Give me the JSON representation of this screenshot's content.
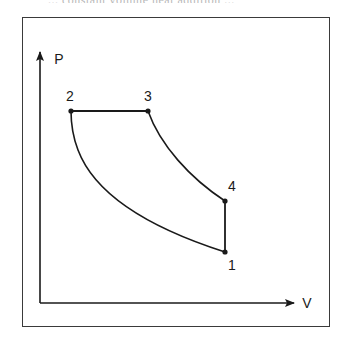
{
  "caption": {
    "text": "... constant volume heat addition ...",
    "note": "cropped, illegible"
  },
  "diagram": {
    "type": "pressure-volume cycle diagram",
    "axes": {
      "y_label": "P",
      "x_label": "V"
    },
    "points": [
      {
        "id": "1",
        "label": "1"
      },
      {
        "id": "2",
        "label": "2"
      },
      {
        "id": "3",
        "label": "3"
      },
      {
        "id": "4",
        "label": "4"
      }
    ],
    "processes": [
      {
        "from": "1",
        "to": "2",
        "shape": "curve"
      },
      {
        "from": "2",
        "to": "3",
        "shape": "horizontal line (constant pressure)"
      },
      {
        "from": "3",
        "to": "4",
        "shape": "curve"
      },
      {
        "from": "4",
        "to": "1",
        "shape": "vertical line (constant volume)"
      }
    ],
    "colors": {
      "line": "#1a1a1a",
      "frame": "#3a3a3a",
      "background": "#ffffff"
    }
  }
}
